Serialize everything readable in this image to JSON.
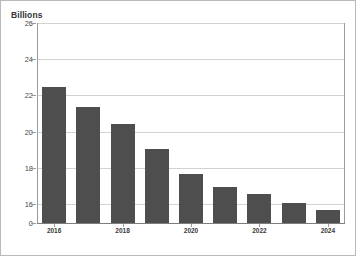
{
  "chart_data": {
    "type": "bar",
    "title": "",
    "unit_label": "Billions",
    "xlabel": "",
    "ylabel": "Billions",
    "categories": [
      "2016",
      "2017",
      "2018",
      "2019",
      "2020",
      "2021",
      "2022",
      "2023",
      "2024"
    ],
    "values": [
      22.5,
      21.4,
      20.5,
      19.1,
      17.7,
      17.0,
      16.6,
      16.1,
      15.7
    ],
    "visible_tick_labels": [
      "2016",
      "2018",
      "2020",
      "2022",
      "2024"
    ],
    "visible_tick_indices": [
      0,
      2,
      4,
      6,
      8
    ],
    "yticks": [
      26,
      24,
      22,
      20,
      18,
      16,
      0
    ],
    "ytick_labels": [
      "26",
      "24",
      "22",
      "20",
      "18",
      "16",
      "0"
    ],
    "ylim": [
      16,
      26
    ],
    "y_axis_break": true,
    "grid": true,
    "legend": false,
    "bar_color": "#4e4e4e",
    "grid_color": "#d2d2d2",
    "axis_color": "#9a9a9a"
  },
  "axis": {
    "y": [
      {
        "label": "26",
        "value": 26
      },
      {
        "label": "24",
        "value": 24
      },
      {
        "label": "22",
        "value": 22
      },
      {
        "label": "20",
        "value": 20
      },
      {
        "label": "18",
        "value": 18
      },
      {
        "label": "16",
        "value": 16
      },
      {
        "label": "0",
        "value": 0
      }
    ],
    "x": [
      {
        "label": "2016",
        "index": 0
      },
      {
        "label": "2018",
        "index": 2
      },
      {
        "label": "2020",
        "index": 4
      },
      {
        "label": "2022",
        "index": 6
      },
      {
        "label": "2024",
        "index": 8
      }
    ]
  }
}
